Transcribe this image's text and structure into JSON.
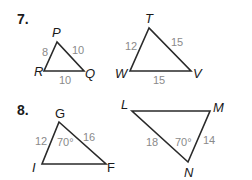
{
  "problems": [
    {
      "number": "7.",
      "triangles": [
        {
          "name": "triangle-PQR",
          "vertices": {
            "P": "P",
            "R": "R",
            "Q": "Q"
          },
          "sides": {
            "PR": "8",
            "PQ": "10",
            "RQ": "10"
          }
        },
        {
          "name": "triangle-TVW",
          "vertices": {
            "T": "T",
            "W": "W",
            "V": "V"
          },
          "sides": {
            "TW": "12",
            "TV": "15",
            "WV": "15"
          }
        }
      ]
    },
    {
      "number": "8.",
      "triangles": [
        {
          "name": "triangle-GIF",
          "vertices": {
            "G": "G",
            "I": "I",
            "F": "F"
          },
          "sides": {
            "GI": "12",
            "GF": "16"
          },
          "angles": {
            "G": "70°"
          }
        },
        {
          "name": "triangle-LMN",
          "vertices": {
            "L": "L",
            "M": "M",
            "N": "N"
          },
          "sides": {
            "LN": "18",
            "MN": "14"
          },
          "angles": {
            "N": "70°"
          }
        }
      ]
    }
  ],
  "colors": {
    "line": "#2a2a2a",
    "label": "#8a8a8a",
    "text": "#1a1a1a"
  }
}
